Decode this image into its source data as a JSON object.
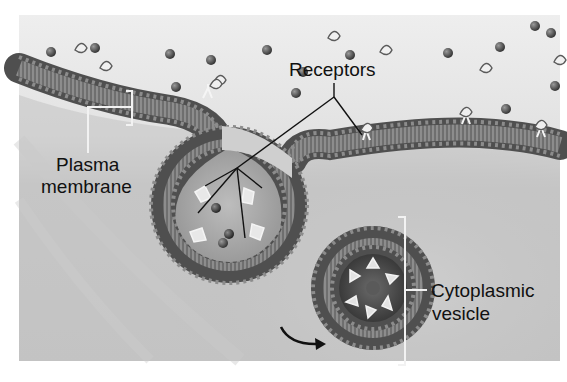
{
  "figure": {
    "style": "grayscale illustration",
    "colors": {
      "background": "#ffffff",
      "extracellular": "#e4e4e4",
      "cytoplasm": "#bdbdbd",
      "membrane_head": "#5a5a5a",
      "membrane_tail": "#8a8a8a",
      "label_text": "#111111",
      "leader_line_dark": "#111111",
      "leader_line_light": "#f2f2f2"
    }
  },
  "labels": {
    "receptors": "Receptors",
    "plasma_membrane_line1": "Plasma",
    "plasma_membrane_line2": "membrane",
    "vesicle_line1": "Cytoplasmic",
    "vesicle_line2": "vesicle"
  },
  "annotations": {
    "arrow": "curved arrow pointing toward cytoplasmic vesicle (vesicle pinching off)",
    "plasma_membrane_bracket": "bracket spanning lipid bilayer thickness",
    "vesicle_bracket": "bracket spanning vesicle diameter"
  }
}
